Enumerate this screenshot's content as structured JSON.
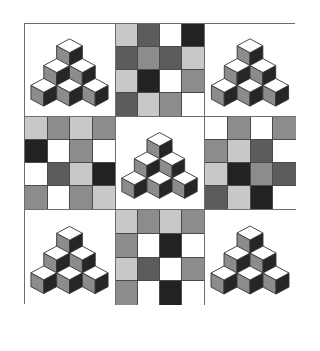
{
  "puzzle": {
    "grid_size": "3x3",
    "colors": {
      "white": "#ffffff",
      "light": "#c8c8c8",
      "mid": "#8c8c8c",
      "dark": "#5c5c5c",
      "black": "#222222",
      "border": "#6e6e6e",
      "cube_top": "#ffffff",
      "cube_left": "#8c8c8c",
      "cube_right": "#262626",
      "cube_edge": "#333333"
    },
    "panels": [
      {
        "position": "top-left",
        "type": "cube-pyramid",
        "cubes": 6
      },
      {
        "position": "top-center",
        "type": "tile-grid",
        "rows": [
          [
            "light",
            "dark",
            "white",
            "black"
          ],
          [
            "dark",
            "mid",
            "dark",
            "light"
          ],
          [
            "light",
            "black",
            "white",
            "mid"
          ],
          [
            "dark",
            "light",
            "mid",
            "white"
          ]
        ]
      },
      {
        "position": "top-right",
        "type": "cube-pyramid",
        "cubes": 6
      },
      {
        "position": "middle-left",
        "type": "tile-grid",
        "rows": [
          [
            "light",
            "mid",
            "light",
            "mid"
          ],
          [
            "black",
            "white",
            "mid",
            "white"
          ],
          [
            "white",
            "dark",
            "light",
            "black"
          ],
          [
            "mid",
            "white",
            "mid",
            "light"
          ]
        ]
      },
      {
        "position": "center",
        "type": "cube-pyramid",
        "cubes": 6
      },
      {
        "position": "middle-right",
        "type": "tile-grid",
        "rows": [
          [
            "white",
            "mid",
            "white",
            "mid"
          ],
          [
            "mid",
            "light",
            "dark",
            "white"
          ],
          [
            "light",
            "black",
            "mid",
            "dark"
          ],
          [
            "dark",
            "light",
            "black",
            "white"
          ]
        ]
      },
      {
        "position": "bottom-left",
        "type": "cube-pyramid",
        "cubes": 6
      },
      {
        "position": "bottom-center",
        "type": "tile-grid",
        "rows": [
          [
            "light",
            "mid",
            "light",
            "mid"
          ],
          [
            "mid",
            "white",
            "black",
            "white"
          ],
          [
            "light",
            "dark",
            "white",
            "mid"
          ],
          [
            "mid",
            "white",
            "black",
            "white"
          ]
        ]
      },
      {
        "position": "bottom-right",
        "type": "cube-pyramid",
        "cubes": 6
      }
    ]
  }
}
